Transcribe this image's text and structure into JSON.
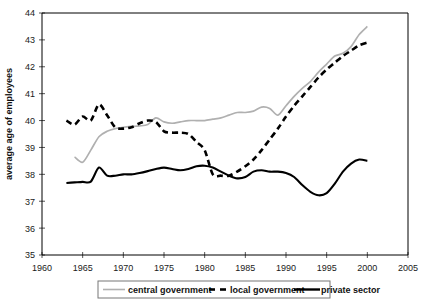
{
  "chart_data": {
    "type": "line",
    "title": "",
    "xlabel": "",
    "ylabel": "average age of employees",
    "xlim": [
      1960,
      2005
    ],
    "ylim": [
      35,
      44
    ],
    "grid": false,
    "legend_position": "bottom",
    "x_ticks": [
      "1960",
      "1965",
      "1970",
      "1975",
      "1980",
      "1985",
      "1990",
      "1995",
      "2000",
      "2005"
    ],
    "y_ticks": [
      "35",
      "36",
      "37",
      "38",
      "39",
      "40",
      "41",
      "42",
      "43",
      "44"
    ],
    "series": [
      {
        "name": "central government",
        "style": "solid-gray",
        "color": "#b0b0b0",
        "x": [
          1964,
          1965,
          1966,
          1967,
          1968,
          1969,
          1970,
          1971,
          1972,
          1973,
          1974,
          1975,
          1976,
          1977,
          1978,
          1979,
          1980,
          1981,
          1982,
          1983,
          1984,
          1985,
          1986,
          1987,
          1988,
          1989,
          1990,
          1991,
          1992,
          1993,
          1994,
          1995,
          1996,
          1997,
          1998,
          1999,
          2000
        ],
        "values": [
          38.65,
          38.45,
          38.9,
          39.4,
          39.6,
          39.7,
          39.75,
          39.78,
          39.8,
          39.85,
          40.1,
          39.95,
          39.9,
          39.95,
          40.0,
          40.0,
          40.0,
          40.05,
          40.1,
          40.2,
          40.3,
          40.3,
          40.35,
          40.5,
          40.45,
          40.2,
          40.55,
          40.9,
          41.2,
          41.45,
          41.8,
          42.1,
          42.4,
          42.5,
          42.75,
          43.2,
          43.5
        ]
      },
      {
        "name": "local government",
        "style": "dashed-black",
        "color": "#000000",
        "x": [
          1963,
          1964,
          1965,
          1966,
          1967,
          1968,
          1969,
          1970,
          1971,
          1972,
          1973,
          1974,
          1975,
          1976,
          1977,
          1978,
          1979,
          1980,
          1981,
          1982,
          1983,
          1984,
          1985,
          1986,
          1987,
          1988,
          1989,
          1990,
          1991,
          1992,
          1993,
          1994,
          1995,
          1996,
          1997,
          1998,
          1999,
          2000
        ],
        "values": [
          40.0,
          39.85,
          40.15,
          40.0,
          40.6,
          40.2,
          39.75,
          39.7,
          39.75,
          39.9,
          40.0,
          39.95,
          39.6,
          39.55,
          39.55,
          39.5,
          39.2,
          38.9,
          38.0,
          37.95,
          37.95,
          38.1,
          38.3,
          38.55,
          38.9,
          39.3,
          39.7,
          40.15,
          40.55,
          40.9,
          41.25,
          41.6,
          41.9,
          42.15,
          42.4,
          42.6,
          42.8,
          42.9
        ]
      },
      {
        "name": "private sector",
        "style": "solid-black",
        "color": "#000000",
        "x": [
          1963,
          1964,
          1965,
          1966,
          1967,
          1968,
          1969,
          1970,
          1971,
          1972,
          1973,
          1974,
          1975,
          1976,
          1977,
          1978,
          1979,
          1980,
          1981,
          1982,
          1983,
          1984,
          1985,
          1986,
          1987,
          1988,
          1989,
          1990,
          1991,
          1992,
          1993,
          1994,
          1995,
          1996,
          1997,
          1998,
          1999,
          2000
        ],
        "values": [
          37.68,
          37.7,
          37.72,
          37.73,
          38.25,
          37.95,
          37.95,
          38.0,
          38.0,
          38.05,
          38.12,
          38.2,
          38.25,
          38.2,
          38.15,
          38.2,
          38.3,
          38.32,
          38.25,
          38.1,
          37.95,
          37.85,
          37.9,
          38.1,
          38.15,
          38.1,
          38.1,
          38.05,
          37.9,
          37.6,
          37.35,
          37.22,
          37.3,
          37.65,
          38.1,
          38.4,
          38.55,
          38.5
        ]
      }
    ]
  },
  "legend": {
    "items": [
      {
        "label": "central government",
        "marker": "line-gray"
      },
      {
        "label": "local government",
        "marker": "line-dashed"
      },
      {
        "label": "private sector",
        "marker": "line-black"
      }
    ]
  }
}
